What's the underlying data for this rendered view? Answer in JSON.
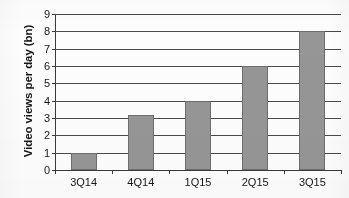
{
  "chart_data": {
    "type": "bar",
    "title": "",
    "subtitle": "",
    "xlabel": "",
    "ylabel": "Video views per day (bn)",
    "categories": [
      "3Q14",
      "4Q14",
      "1Q15",
      "2Q15",
      "3Q15"
    ],
    "values": [
      1,
      3.2,
      4,
      6,
      8
    ],
    "series": [
      {
        "name": "Video views per day (bn)",
        "values": [
          1,
          3.2,
          4,
          6,
          8
        ]
      }
    ],
    "ylim": [
      0,
      9
    ],
    "y_ticks": [
      0,
      1,
      2,
      3,
      4,
      5,
      6,
      7,
      8,
      9
    ],
    "y_tick_labels": [
      "0",
      "1",
      "2",
      "3",
      "4",
      "5",
      "6",
      "7",
      "8",
      "9"
    ],
    "grid": true,
    "grid_axis": "y",
    "legend": false,
    "legend_position": "none",
    "bar_color": "#969696",
    "bar_border_color": "#6e6e6e",
    "axis_color": "#3a3a3a",
    "gridline_color": "#4a4a4a",
    "text_color": "#161616",
    "background_color": "#ffffff"
  }
}
